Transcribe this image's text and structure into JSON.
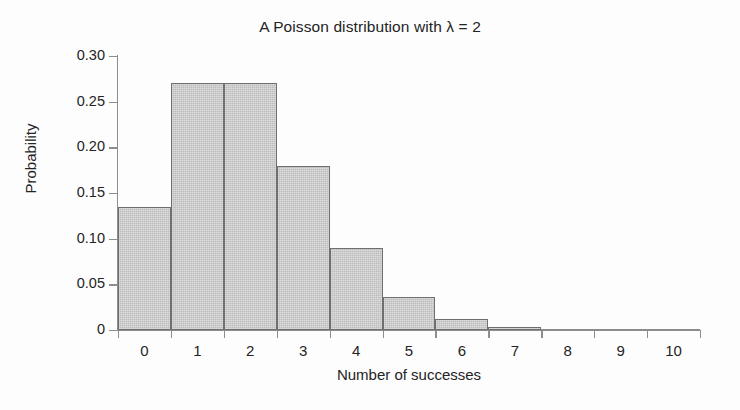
{
  "chart_data": {
    "type": "bar",
    "title": "A Poisson distribution with λ = 2",
    "xlabel": "Number of successes",
    "ylabel": "Probability",
    "categories": [
      "0",
      "1",
      "2",
      "3",
      "4",
      "5",
      "6",
      "7",
      "8",
      "9",
      "10"
    ],
    "values": [
      0.135,
      0.271,
      0.271,
      0.18,
      0.09,
      0.036,
      0.012,
      0.0034,
      0.0009,
      0.0002,
      0.0
    ],
    "ylim": [
      0,
      0.3
    ],
    "xlim": [
      -0.5,
      10.5
    ],
    "ytick_labels": [
      "0",
      "0.05",
      "0.10",
      "0.15",
      "0.20",
      "0.25",
      "0.30"
    ],
    "ytick_values": [
      0,
      0.05,
      0.1,
      0.15,
      0.2,
      0.25,
      0.3
    ],
    "xtick_labels": [
      "0",
      "1",
      "2",
      "3",
      "4",
      "5",
      "6",
      "7",
      "8",
      "9",
      "10"
    ],
    "grid": false,
    "legend": null,
    "legend_position": "none",
    "bar_fill_color": "#c9c9c9",
    "bar_edge_color": "#6f6f6f",
    "axis_color": "#8d8d8d",
    "background_color": "#fdfdfd",
    "annotations": []
  }
}
